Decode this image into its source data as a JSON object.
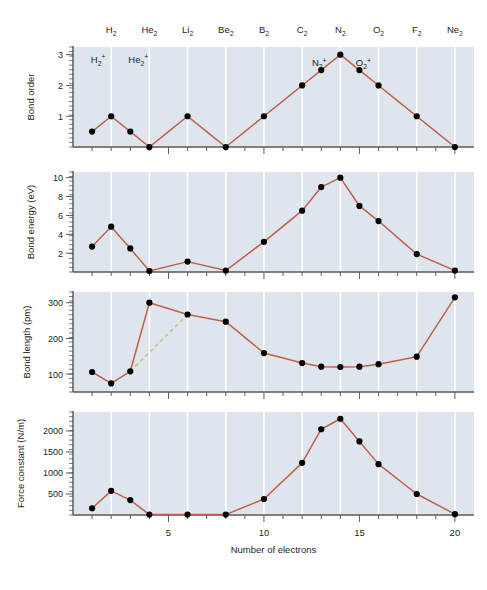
{
  "figure": {
    "background": "#ffffff",
    "plot_background": "#dee5ec",
    "line_color": "#c0604a",
    "marker_color": "#000000",
    "dashed_color": "#cbbb84",
    "gridline_color": "#ffffff",
    "axis_color": "#5a5a5a"
  },
  "molecule_labels": [
    {
      "text": "H",
      "sub": "2",
      "electrons": 2
    },
    {
      "text": "He",
      "sub": "2",
      "electrons": 4
    },
    {
      "text": "Li",
      "sub": "2",
      "electrons": 6
    },
    {
      "text": "Be",
      "sub": "2",
      "electrons": 8
    },
    {
      "text": "B",
      "sub": "2",
      "electrons": 10
    },
    {
      "text": "C",
      "sub": "2",
      "electrons": 12
    },
    {
      "text": "N",
      "sub": "2",
      "electrons": 14
    },
    {
      "text": "O",
      "sub": "2",
      "electrons": 16
    },
    {
      "text": "F",
      "sub": "2",
      "electrons": 18
    },
    {
      "text": "Ne",
      "sub": "2",
      "electrons": 20
    }
  ],
  "ion_labels": [
    {
      "text": "H",
      "sub": "2",
      "sup": "+",
      "electrons": 1
    },
    {
      "text": "He",
      "sub": "2",
      "sup": "+",
      "electrons": 3
    },
    {
      "text": "N",
      "sub": "2",
      "sup": "+",
      "electrons": 13
    },
    {
      "text": "O",
      "sub": "2",
      "sup": "+",
      "electrons": 15
    }
  ],
  "xaxis": {
    "label": "Number of electrons",
    "min": 0,
    "max": 21,
    "ticks": [
      5,
      10,
      15,
      20
    ],
    "tick_labels": [
      "5",
      "10",
      "15",
      "20"
    ],
    "minor_tick_step": 1
  },
  "chart_data": [
    {
      "type": "line",
      "title": "Bond order",
      "ylabel": "Bond order",
      "xlabel": "Number of electrons",
      "ylim": [
        0,
        3.25
      ],
      "yticks": [
        1,
        2,
        3
      ],
      "ytick_labels": [
        "1",
        "2",
        "3"
      ],
      "grid": true,
      "legend": "none",
      "x": [
        1,
        2,
        3,
        4,
        5,
        6,
        7,
        8,
        9,
        10,
        11,
        12,
        13,
        14,
        15,
        16,
        17,
        18,
        19,
        20
      ],
      "values": [
        0.5,
        1,
        0.5,
        0,
        0.5,
        1,
        0.5,
        0,
        0.5,
        1,
        1.5,
        2,
        2.5,
        3,
        2.5,
        2,
        1.5,
        1,
        0.5,
        0
      ],
      "markers_at": [
        1,
        2,
        3,
        4,
        6,
        8,
        10,
        12,
        13,
        14,
        15,
        16,
        18,
        20
      ],
      "marker_values": [
        0.5,
        1,
        0.5,
        0,
        1,
        0,
        1,
        2,
        2.5,
        3,
        2.5,
        2,
        1,
        0
      ]
    },
    {
      "type": "line",
      "title": "Bond energy",
      "ylabel": "Bond energy (eV)",
      "xlabel": "Number of electrons",
      "ylim": [
        0,
        10.6
      ],
      "yticks": [
        2,
        4,
        6,
        8,
        10
      ],
      "ytick_labels": [
        "2",
        "4",
        "6",
        "8",
        "10"
      ],
      "grid": true,
      "legend": "none",
      "x": [
        1,
        2,
        3,
        4,
        6,
        8,
        10,
        12,
        13,
        14,
        15,
        16,
        18,
        20
      ],
      "values": [
        2.7,
        4.8,
        2.5,
        0.1,
        1.1,
        0.15,
        3.2,
        6.5,
        9.0,
        10.0,
        7.0,
        5.4,
        1.9,
        0.15
      ]
    },
    {
      "type": "line",
      "title": "Bond length",
      "ylabel": "Bond length (pm)",
      "xlabel": "Number of electrons",
      "ylim": [
        50,
        330
      ],
      "yticks": [
        100,
        200,
        300
      ],
      "ytick_labels": [
        "100",
        "200",
        "300"
      ],
      "grid": true,
      "legend": "none",
      "x": [
        1,
        2,
        3,
        4,
        6,
        8,
        10,
        12,
        13,
        14,
        15,
        16,
        18,
        20
      ],
      "values": [
        106,
        74,
        108,
        300,
        267,
        247,
        159,
        131,
        121,
        120,
        121,
        128,
        149,
        315
      ],
      "dashed_segment": {
        "x": [
          3,
          6
        ],
        "values": [
          108,
          267
        ]
      }
    },
    {
      "type": "line",
      "title": "Force constant",
      "ylabel": "Force constant (N/m)",
      "xlabel": "Number of electrons",
      "ylim": [
        0,
        2450
      ],
      "yticks": [
        500,
        1000,
        1500,
        2000
      ],
      "ytick_labels": [
        "500",
        "1000",
        "1500",
        "2000"
      ],
      "grid": true,
      "legend": "none",
      "x": [
        1,
        2,
        3,
        4,
        6,
        8,
        10,
        12,
        13,
        14,
        15,
        16,
        18,
        20
      ],
      "values": [
        160,
        575,
        355,
        10,
        10,
        10,
        380,
        1240,
        2040,
        2290,
        1750,
        1210,
        500,
        20
      ]
    }
  ]
}
